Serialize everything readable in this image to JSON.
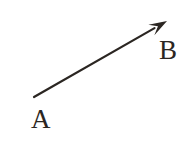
{
  "figure": {
    "kind": "vector-arrow-diagram",
    "background_color": "#ffffff",
    "width": 189,
    "height": 146
  },
  "arrow": {
    "name": "vector-AB",
    "stroke_color": "#2b2622",
    "stroke_width": 2.2,
    "tail": {
      "x": 34,
      "y": 97
    },
    "tip": {
      "x": 167,
      "y": 21
    },
    "head": {
      "shape": "solid-triangle",
      "length": 18,
      "half_width": 6
    }
  },
  "labels": {
    "start": {
      "text": "A",
      "color": "#2b2622",
      "x": 31,
      "y": 106
    },
    "end": {
      "text": "B",
      "color": "#2b2622",
      "x": 159,
      "y": 37
    }
  }
}
